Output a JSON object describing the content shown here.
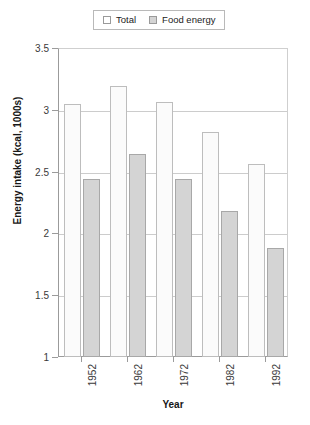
{
  "chart_data": {
    "type": "bar",
    "title": "",
    "xlabel": "Year",
    "ylabel": "Energy intake (kcal, 1000s)",
    "categories": [
      "1952",
      "1962",
      "1972",
      "1982",
      "1992"
    ],
    "series": [
      {
        "name": "Total",
        "values": [
          3.05,
          3.19,
          3.06,
          2.82,
          2.56
        ],
        "color": "#fbfbfb"
      },
      {
        "name": "Food energy",
        "values": [
          2.44,
          2.64,
          2.44,
          2.18,
          1.88
        ],
        "color": "#d4d4d4"
      }
    ],
    "ylim": [
      1,
      3.5
    ],
    "yticks": [
      "1",
      "1.5",
      "2",
      "2.5",
      "3",
      "3.5"
    ],
    "ytick_values": [
      1,
      1.5,
      2,
      2.5,
      3,
      3.5
    ],
    "grid": true,
    "legend_position": "top-center"
  },
  "legend": {
    "entries": [
      {
        "label": "Total",
        "swatch": "white-square-icon"
      },
      {
        "label": "Food energy",
        "swatch": "gray-square-icon"
      }
    ]
  },
  "axes": {
    "y_title": "Energy intake (kcal, 1000s)",
    "x_title": "Year"
  }
}
